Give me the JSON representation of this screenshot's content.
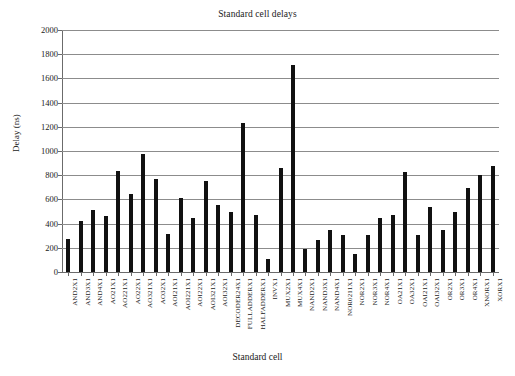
{
  "chart_data": {
    "type": "bar",
    "title": "Standard cell delays",
    "xlabel": "Standard cell",
    "ylabel": "Delay (ns)",
    "ylim": [
      0,
      2000
    ],
    "ytick_step": 200,
    "yticks": [
      0,
      200,
      400,
      600,
      800,
      1000,
      1200,
      1400,
      1600,
      1800,
      2000
    ],
    "grid": "horizontal",
    "legend": "none",
    "bar_color": "#111111",
    "gridline_color": "#8c8c8c",
    "axis_color": "#6b6b6b",
    "categories": [
      "AND2X1",
      "AND3X1",
      "AND4X1",
      "AO21X1",
      "AO221X1",
      "AO22X1",
      "AO321X1",
      "AO32X1",
      "AOI21X1",
      "AOI221X1",
      "AOI22X1",
      "AOI321X1",
      "AOI32X1",
      "DECODER24X1",
      "FULLADDERX1",
      "HALFADDERX1",
      "INVX1",
      "MUX2X1",
      "MUX4X1",
      "NAND2X1",
      "NAND3X1",
      "NAND4X1",
      "NOR0211X1",
      "NOR2X1",
      "NOR3X1",
      "NOR4X1",
      "OA21X1",
      "OA32X1",
      "OAI21X1",
      "OAI32X1",
      "OR2X1",
      "OR3X1",
      "OR4X1",
      "XNORX1",
      "XORX1"
    ],
    "values": [
      270,
      418,
      515,
      467,
      835,
      648,
      975,
      770,
      318,
      615,
      443,
      755,
      552,
      493,
      1230,
      475,
      110,
      858,
      1710,
      190,
      265,
      345,
      307,
      150,
      307,
      447,
      468,
      828,
      302,
      538,
      345,
      495,
      692,
      805,
      873
    ]
  }
}
